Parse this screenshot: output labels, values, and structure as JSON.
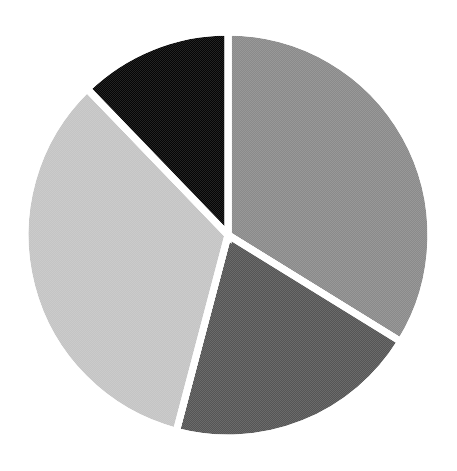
{
  "chart_data": {
    "type": "pie",
    "title": "",
    "categories": [
      "Slice A",
      "Slice B",
      "Slice C",
      "Slice D"
    ],
    "values": [
      33.8,
      20.3,
      33.7,
      12.2
    ],
    "unit": "%",
    "start_angle_deg": 0,
    "direction": "clockwise",
    "colors": [
      "#8a8a8a",
      "#555555",
      "#c4c4c4",
      "#050505"
    ],
    "legend": "none",
    "labels_shown": false
  },
  "layout": {
    "cx": 228,
    "cy": 235,
    "r": 203
  }
}
